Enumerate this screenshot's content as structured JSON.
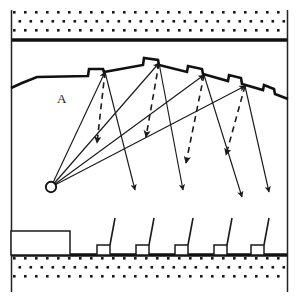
{
  "figure": {
    "type": "technical-line-diagram",
    "width": 297,
    "height": 302,
    "background_color": "#ffffff",
    "line_color": "#1a1a1a",
    "labels": [
      {
        "name": "region-label-a",
        "text": "A",
        "x": 57,
        "y": 103
      }
    ],
    "frame": {
      "left_x": 11,
      "right_x": 288,
      "top_y": 10,
      "bottom_y": 292
    },
    "top_layer": {
      "name": "upper-stippled-rock-band",
      "fill_pattern": "square-dot-stipple",
      "top_y": 11,
      "bottom_y": 38,
      "baseline_y": 40,
      "baseline_thickness": 3.4,
      "dot_rows": 3,
      "dot_spacing_x": 11,
      "dot_spacing_y": 9,
      "dot_size": 2.6
    },
    "bottom_layer": {
      "name": "lower-stippled-rock-band",
      "fill_pattern": "square-dot-stipple",
      "top_y": 257,
      "bottom_y": 284,
      "baseline_y": 255,
      "baseline_thickness": 3.4,
      "dot_rows": 3,
      "dot_spacing_x": 11,
      "dot_spacing_y": 9,
      "dot_size": 2.6
    },
    "ridge": {
      "name": "serrated-ridge-profile",
      "description": "Stair-stepped sawtooth ridge rising to a crest then descending to the right",
      "stroke_width": 2.6,
      "points": [
        [
          11,
          88
        ],
        [
          22,
          83
        ],
        [
          37,
          77
        ],
        [
          88,
          76
        ],
        [
          89,
          69
        ],
        [
          103,
          69
        ],
        [
          104,
          72
        ],
        [
          143,
          65
        ],
        [
          144,
          58
        ],
        [
          158,
          60
        ],
        [
          159,
          65
        ],
        [
          187,
          72
        ],
        [
          188,
          66
        ],
        [
          202,
          69
        ],
        [
          203,
          74
        ],
        [
          228,
          81
        ],
        [
          229,
          75
        ],
        [
          241,
          78
        ],
        [
          242,
          84
        ],
        [
          263,
          90
        ],
        [
          264,
          85
        ],
        [
          274,
          89
        ],
        [
          275,
          94
        ],
        [
          288,
          99
        ]
      ]
    },
    "source": {
      "name": "wave-source-point",
      "shape": "circle",
      "cx": 51,
      "cy": 187,
      "r": 5.2
    },
    "incident_rays": {
      "name": "incident-rays-from-source",
      "style": "solid",
      "arrowhead_at": "ridge-peak",
      "paths": [
        {
          "from": [
            51,
            187
          ],
          "to": [
            105,
            72
          ]
        },
        {
          "from": [
            51,
            187
          ],
          "to": [
            159,
            63
          ]
        },
        {
          "from": [
            51,
            187
          ],
          "to": [
            204,
            75
          ]
        },
        {
          "from": [
            51,
            187
          ],
          "to": [
            245,
            86
          ]
        }
      ]
    },
    "transmitted_rays": {
      "name": "transmitted-descending-rays",
      "style": "solid",
      "arrowhead_at": "lower-end",
      "paths": [
        {
          "from": [
            105,
            72
          ],
          "to": [
            135,
            190
          ]
        },
        {
          "from": [
            159,
            63
          ],
          "to": [
            183,
            190
          ]
        },
        {
          "from": [
            204,
            75
          ],
          "to": [
            242,
            197
          ]
        },
        {
          "from": [
            245,
            86
          ],
          "to": [
            269,
            192
          ]
        }
      ]
    },
    "diffracted_rays": {
      "name": "diffracted-rays-dashed",
      "style": "dashed",
      "arrowhead_at": "lower-end",
      "paths": [
        {
          "from": [
            105,
            72
          ],
          "to": [
            97,
            143
          ]
        },
        {
          "from": [
            159,
            63
          ],
          "to": [
            146,
            137
          ]
        },
        {
          "from": [
            204,
            75
          ],
          "to": [
            186,
            163
          ]
        },
        {
          "from": [
            245,
            86
          ],
          "to": [
            226,
            155
          ]
        }
      ]
    },
    "building": {
      "name": "large-ground-building",
      "x": 11,
      "y": 231,
      "width": 59,
      "height": 24
    },
    "antenna_structures": {
      "name": "antenna-structures-row",
      "count": 5,
      "box_width": 13,
      "box_height": 10,
      "mast_height": 27,
      "mast_lean_x": 5,
      "base_y": 255,
      "x_positions": [
        97,
        136,
        175,
        214,
        251
      ]
    }
  }
}
